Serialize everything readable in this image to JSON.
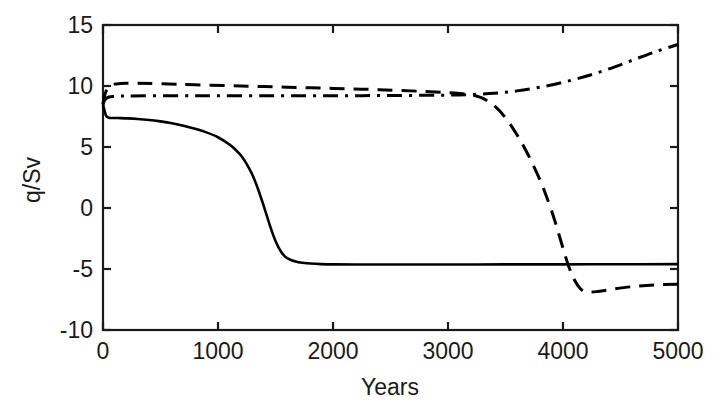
{
  "chart_data": {
    "type": "line",
    "title": "",
    "xlabel": "Years",
    "ylabel": "q/Sv",
    "xlim": [
      0,
      5000
    ],
    "ylim": [
      -10,
      15
    ],
    "xticks": [
      0,
      1000,
      2000,
      3000,
      4000,
      5000
    ],
    "xticklabels": [
      "0",
      "1000",
      "2000",
      "3000",
      "4000",
      "5000"
    ],
    "yticks": [
      -10,
      -5,
      0,
      5,
      10,
      15
    ],
    "yticklabels": [
      "-10",
      "-5",
      "0",
      "5",
      "10",
      "15"
    ],
    "grid": false,
    "legend": "none",
    "box": true,
    "series": [
      {
        "name": "solid-collapse",
        "style": "solid",
        "color": "#000000",
        "x": [
          0,
          25,
          50,
          100,
          150,
          200,
          300,
          400,
          500,
          600,
          700,
          800,
          900,
          1000,
          1100,
          1150,
          1200,
          1250,
          1300,
          1350,
          1400,
          1450,
          1500,
          1550,
          1600,
          1700,
          1800,
          1900,
          2000,
          2200,
          2500,
          3000,
          3500,
          4000,
          4500,
          5000
        ],
        "y": [
          8.5,
          7.6,
          7.4,
          7.38,
          7.37,
          7.35,
          7.3,
          7.22,
          7.1,
          6.95,
          6.75,
          6.5,
          6.2,
          5.8,
          5.2,
          4.8,
          4.3,
          3.6,
          2.7,
          1.5,
          0.1,
          -1.4,
          -2.7,
          -3.6,
          -4.1,
          -4.45,
          -4.55,
          -4.6,
          -4.62,
          -4.63,
          -4.63,
          -4.63,
          -4.62,
          -4.62,
          -4.61,
          -4.6
        ]
      },
      {
        "name": "dashed-late-collapse",
        "style": "dashed",
        "color": "#000000",
        "x": [
          0,
          20,
          50,
          100,
          150,
          200,
          300,
          500,
          800,
          1200,
          1600,
          2000,
          2400,
          2800,
          3000,
          3100,
          3200,
          3300,
          3400,
          3500,
          3600,
          3700,
          3800,
          3850,
          3900,
          3950,
          4000,
          4050,
          4100,
          4150,
          4200,
          4300,
          4400,
          4600,
          4800,
          5000
        ],
        "y": [
          8.5,
          9.4,
          9.9,
          10.15,
          10.2,
          10.22,
          10.22,
          10.18,
          10.1,
          10.0,
          9.9,
          9.8,
          9.7,
          9.55,
          9.45,
          9.38,
          9.28,
          9.0,
          8.4,
          7.4,
          6.0,
          4.3,
          2.3,
          1.1,
          -0.2,
          -1.7,
          -3.3,
          -4.8,
          -5.9,
          -6.6,
          -6.88,
          -6.85,
          -6.7,
          -6.45,
          -6.3,
          -6.25
        ]
      },
      {
        "name": "dashdot-recovery",
        "style": "dashdot",
        "color": "#000000",
        "x": [
          0,
          20,
          50,
          100,
          200,
          400,
          700,
          1000,
          1500,
          2000,
          2500,
          3000,
          3200,
          3400,
          3600,
          3800,
          4000,
          4200,
          4400,
          4600,
          4800,
          5000
        ],
        "y": [
          8.5,
          8.9,
          9.1,
          9.15,
          9.18,
          9.2,
          9.2,
          9.2,
          9.2,
          9.2,
          9.22,
          9.25,
          9.3,
          9.4,
          9.6,
          9.9,
          10.3,
          10.8,
          11.4,
          12.1,
          12.8,
          13.4
        ]
      }
    ]
  },
  "axes": {
    "xlabel": "Years",
    "ylabel": "q/Sv"
  }
}
